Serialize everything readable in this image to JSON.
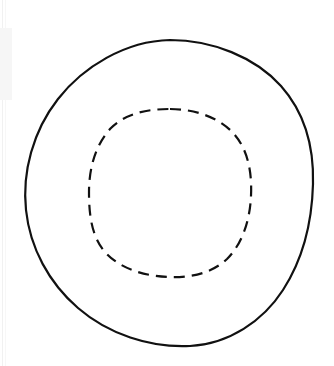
{
  "document": {
    "title": "Concentric Circles Line Drawing",
    "type": "line-art-diagram",
    "background_color": "#ffffff",
    "width": 334,
    "height": 366
  },
  "shapes": {
    "outer_circle": {
      "name": "outer-solid-circle",
      "style": "solid",
      "stroke_color": "#111111",
      "stroke_width": 2.2,
      "fill": "none",
      "center_x": 170,
      "center_y": 193,
      "radius_x": 144,
      "radius_y": 153,
      "bounds": {
        "left": 26,
        "top": 40,
        "right": 314,
        "bottom": 346
      },
      "hand_drawn": true
    },
    "inner_circle": {
      "name": "inner-dashed-circle",
      "style": "dashed",
      "stroke_color": "#111111",
      "stroke_width": 2.2,
      "fill": "none",
      "center_x": 170,
      "center_y": 193,
      "radius_x": 81,
      "radius_y": 84,
      "bounds": {
        "left": 89,
        "top": 109,
        "right": 251,
        "bottom": 277
      },
      "dash_length": 11,
      "gap_length": 7,
      "hand_drawn": true
    }
  },
  "artifacts": {
    "scan_edge_color": "#f1f1f1",
    "scan_smudge_color": "#f6f6f6"
  }
}
